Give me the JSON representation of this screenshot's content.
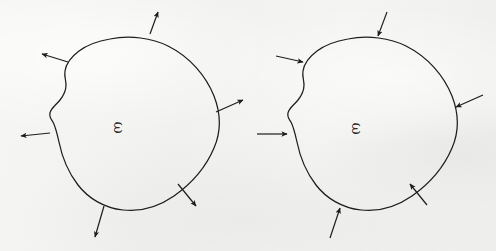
{
  "page": {
    "background_color": "#f3f3f1",
    "ink_color": "#1d1d1d",
    "width": 496,
    "height": 251,
    "style": "hand-drawn pencil sketch on off-white paper"
  },
  "figures": [
    {
      "id": "left-figure",
      "position": "left",
      "region_label": "ω",
      "region_label_rotation_degrees": 90,
      "boundary": "closed smooth hand-drawn blob with a concave notch on the upper-left side",
      "arrow_direction": "outward",
      "arrow_count": 5,
      "arrows": [
        {
          "name": "arrow-top",
          "label": "",
          "direction": "outward",
          "angle_degrees": -63
        },
        {
          "name": "arrow-upper-left",
          "label": "",
          "direction": "outward",
          "angle_degrees": 194
        },
        {
          "name": "arrow-right",
          "label": "",
          "direction": "outward",
          "angle_degrees": -22
        },
        {
          "name": "arrow-left",
          "label": "",
          "direction": "outward",
          "angle_degrees": 181
        },
        {
          "name": "arrow-bottom-right",
          "label": "",
          "direction": "outward",
          "angle_degrees": 56
        },
        {
          "name": "arrow-bottom",
          "label": "",
          "direction": "outward",
          "angle_degrees": 104
        }
      ]
    },
    {
      "id": "right-figure",
      "position": "right",
      "region_label": "ω",
      "region_label_rotation_degrees": 90,
      "boundary": "closed smooth hand-drawn blob with a concave notch on the upper-left side",
      "arrow_direction": "inward",
      "arrow_count": 5,
      "arrows": [
        {
          "name": "arrow-top",
          "label": "",
          "direction": "inward",
          "angle_degrees": 117
        },
        {
          "name": "arrow-upper-left",
          "label": "",
          "direction": "inward",
          "angle_degrees": 10
        },
        {
          "name": "arrow-right",
          "label": "",
          "direction": "inward",
          "angle_degrees": 160
        },
        {
          "name": "arrow-left",
          "label": "",
          "direction": "inward",
          "angle_degrees": 0
        },
        {
          "name": "arrow-bottom-right",
          "label": "",
          "direction": "inward",
          "angle_degrees": -122
        },
        {
          "name": "arrow-bottom",
          "label": "",
          "direction": "inward",
          "angle_degrees": -76
        }
      ]
    }
  ]
}
